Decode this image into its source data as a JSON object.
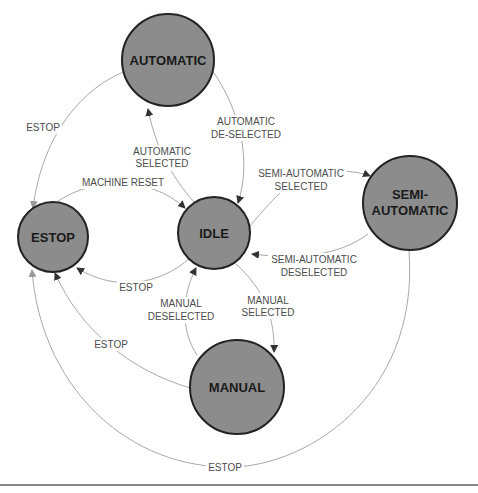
{
  "diagram": {
    "type": "state-machine",
    "colors": {
      "state_fill": "#8c8c8c",
      "state_stroke": "#222222",
      "edge": "#a9a9a9",
      "edge_label": "#4d4d4d",
      "state_label": "#1a1a1a"
    },
    "states": [
      {
        "id": "automatic",
        "label": "AUTOMATIC"
      },
      {
        "id": "estop",
        "label": "ESTOP"
      },
      {
        "id": "idle",
        "label": "IDLE"
      },
      {
        "id": "semi",
        "label_line1": "SEMI-",
        "label_line2": "AUTOMATIC"
      },
      {
        "id": "manual",
        "label": "MANUAL"
      }
    ],
    "transitions": [
      {
        "from": "automatic",
        "to": "estop",
        "label": "ESTOP"
      },
      {
        "from": "idle",
        "to": "automatic",
        "line1": "AUTOMATIC",
        "line2": "SELECTED"
      },
      {
        "from": "automatic",
        "to": "idle",
        "line1": "AUTOMATIC",
        "line2": "DE-SELECTED"
      },
      {
        "from": "estop",
        "to": "idle",
        "label": "MACHINE RESET"
      },
      {
        "from": "idle",
        "to": "semi",
        "line1": "SEMI-AUTOMATIC",
        "line2": "SELECTED"
      },
      {
        "from": "semi",
        "to": "idle",
        "line1": "SEMI-AUTOMATIC",
        "line2": "DESELECTED"
      },
      {
        "from": "idle",
        "to": "estop",
        "label": "ESTOP"
      },
      {
        "from": "manual",
        "to": "idle",
        "line1": "MANUAL",
        "line2": "DESELECTED"
      },
      {
        "from": "idle",
        "to": "manual",
        "line1": "MANUAL",
        "line2": "SELECTED"
      },
      {
        "from": "manual",
        "to": "estop",
        "label": "ESTOP"
      },
      {
        "from": "semi",
        "to": "estop",
        "label": "ESTOP"
      }
    ]
  }
}
